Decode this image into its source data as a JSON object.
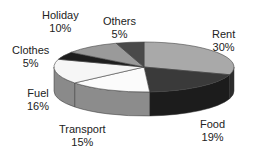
{
  "chart_data": {
    "type": "pie",
    "style": "3d-exploded-none",
    "title": "",
    "legend": "none",
    "slices": [
      {
        "label": "Rent",
        "value": 30,
        "pct_label": "30%",
        "top_color": "#a9a9a9",
        "side_color": "#2c2c2c"
      },
      {
        "label": "Food",
        "value": 19,
        "pct_label": "19%",
        "top_color": "#3a3a3a",
        "side_color": "#1c1c1c"
      },
      {
        "label": "Transport",
        "value": 15,
        "pct_label": "15%",
        "top_color": "#fbfbfb",
        "side_color": "#8c8c8c"
      },
      {
        "label": "Fuel",
        "value": 16,
        "pct_label": "16%",
        "top_color": "#f6f6f6",
        "side_color": "#8a8a8a"
      },
      {
        "label": "Clothes",
        "value": 5,
        "pct_label": "5%",
        "top_color": "#1e1e1e",
        "side_color": "#1e1e1e"
      },
      {
        "label": "Holiday",
        "value": 10,
        "pct_label": "10%",
        "top_color": "#9a9a9a",
        "side_color": "#7a7a7a"
      },
      {
        "label": "Others",
        "value": 5,
        "pct_label": "5%",
        "top_color": "#4a4a4a",
        "side_color": "#3a3a3a"
      }
    ],
    "start_angle_deg": 0,
    "direction": "clockwise"
  },
  "labels": {
    "rent": {
      "name": "Rent",
      "pct": "30%"
    },
    "food": {
      "name": "Food",
      "pct": "19%"
    },
    "transport": {
      "name": "Transport",
      "pct": "15%"
    },
    "fuel": {
      "name": "Fuel",
      "pct": "16%"
    },
    "clothes": {
      "name": "Clothes",
      "pct": "5%"
    },
    "holiday": {
      "name": "Holiday",
      "pct": "10%"
    },
    "others": {
      "name": "Others",
      "pct": "5%"
    }
  }
}
